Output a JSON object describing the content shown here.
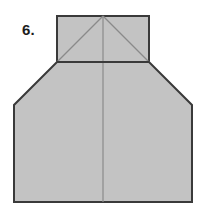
{
  "figure": {
    "label": "6.",
    "caption_text": "6.",
    "background_color": "#ffffff",
    "fill_color": "#c3c3c3",
    "outline_color": "#3a3a3a",
    "fold_line_color": "#8a8a8a",
    "outline_width": "2",
    "fold_line_width": "1",
    "parts": {
      "top_flap": {
        "name": "top-rectangle-flap",
        "points": "57,16 149,16 149,62 57,62",
        "description": "rectangular top flap"
      },
      "body": {
        "name": "main-body-polygon",
        "points": "57,62 149,62 192,105 192,202 14,202 14,105",
        "description": "main body with chamfered upper corners"
      },
      "diagonal_left": {
        "name": "fold-diagonal-left",
        "x1": "57",
        "y1": "62",
        "x2": "103",
        "y2": "16"
      },
      "diagonal_right": {
        "name": "fold-diagonal-right",
        "x1": "149",
        "y1": "62",
        "x2": "103",
        "y2": "16"
      },
      "center_fold": {
        "name": "fold-center-vertical",
        "x1": "103",
        "y1": "16",
        "x2": "103",
        "y2": "202"
      },
      "neck_divider": {
        "name": "fold-horizontal-neck",
        "x1": "57",
        "y1": "62",
        "x2": "149",
        "y2": "62"
      }
    }
  }
}
